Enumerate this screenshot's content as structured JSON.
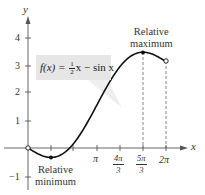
{
  "chart_data": {
    "type": "line",
    "title": "",
    "function_label": "f(x) = ½x − sin x",
    "xlabel": "x",
    "ylabel": "y",
    "xlim": [
      0,
      6.2832
    ],
    "ylim": [
      -1,
      4
    ],
    "x_ticks": [
      "π/3",
      "2π/3",
      "π",
      "4π/3",
      "5π/3",
      "2π"
    ],
    "x_tick_labels_shown": [
      "π",
      "4π/3",
      "5π/3",
      "2π"
    ],
    "y_ticks": [
      -1,
      1,
      2,
      3,
      4
    ],
    "grid": false,
    "legend": null,
    "series": [
      {
        "name": "f(x) = (1/2)x − sin x",
        "x": [
          0,
          0.5236,
          1.0472,
          1.5708,
          2.0944,
          2.618,
          3.1416,
          3.6652,
          4.1888,
          4.7124,
          5.236,
          5.7596,
          6.2832
        ],
        "y": [
          0,
          -0.238,
          -0.342,
          -0.215,
          0.181,
          0.809,
          1.571,
          2.333,
          2.96,
          3.356,
          3.484,
          3.38,
          3.142
        ]
      }
    ],
    "points": [
      {
        "label": "Relative minimum",
        "x": "π/3",
        "y": -0.342,
        "marker": "filled"
      },
      {
        "label": "Relative maximum",
        "x": "5π/3",
        "y": 3.484,
        "marker": "filled"
      },
      {
        "label": "endpoint",
        "x": 0,
        "y": 0,
        "marker": "open"
      },
      {
        "label": "endpoint",
        "x": "2π",
        "y": 3.142,
        "marker": "open"
      }
    ],
    "annotations": [
      "Relative maximum",
      "Relative minimum",
      "f(x) = ½x − sin x"
    ],
    "dashed_guides": [
      "x = 5π/3",
      "x = 2π"
    ]
  },
  "labels": {
    "y_axis": "y",
    "x_axis": "x",
    "y4": "4",
    "y3": "3",
    "y2": "2",
    "y1": "1",
    "yneg1": "−1",
    "pi": "π",
    "four_pi_num": "4π",
    "five_pi_num": "5π",
    "three": "3",
    "two_pi": "2π",
    "rel_max_1": "Relative",
    "rel_max_2": "maximum",
    "rel_min_1": "Relative",
    "rel_min_2": "minimum",
    "fn_lhs": "f(x) = ",
    "fn_num": "1",
    "fn_den": "2",
    "fn_rhs": "x − sin x"
  }
}
